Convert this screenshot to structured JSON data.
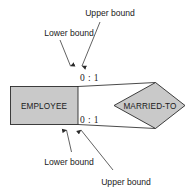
{
  "diagram": {
    "type": "er-diagram-min-max-notation",
    "entity": {
      "name": "EMPLOYEE",
      "shape": "rectangle"
    },
    "relationship": {
      "name": "MARRIED-TO",
      "shape": "diamond"
    },
    "cardinalities": [
      {
        "id": "top",
        "text": "0 : 1"
      },
      {
        "id": "bottom",
        "text": "0 : 1"
      }
    ],
    "annotations": [
      {
        "id": "top-upper",
        "text": "Upper bound"
      },
      {
        "id": "top-lower",
        "text": "Lower bound"
      },
      {
        "id": "bottom-lower",
        "text": "Lower bound"
      },
      {
        "id": "bottom-upper",
        "text": "Upper bound"
      }
    ],
    "colors": {
      "shape_fill": "#c9c9c9",
      "stroke": "#2a2a2a",
      "text": "#1a1a1a",
      "background": "#ffffff"
    }
  }
}
